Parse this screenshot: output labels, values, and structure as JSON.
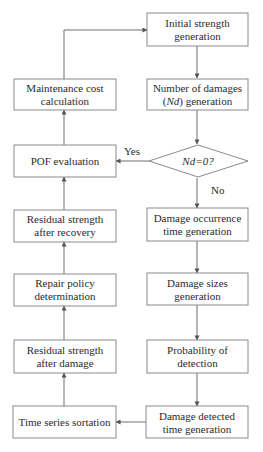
{
  "diagram": {
    "type": "flowchart",
    "nodes": {
      "initial_strength": {
        "lines": [
          "Initial strength",
          "generation"
        ]
      },
      "number_of_damages": {
        "line1": "Number of damages",
        "line2_pre": "(",
        "line2_ital": "Nd",
        "line2_post": ") generation"
      },
      "decision": {
        "ital": "Nd",
        "rest": "=0?"
      },
      "damage_occurrence": {
        "lines": [
          "Damage occurrence",
          "time generation"
        ]
      },
      "damage_sizes": {
        "lines": [
          "Damage sizes",
          "generation"
        ]
      },
      "probability_detection": {
        "lines": [
          "Probability of",
          "detection"
        ]
      },
      "damage_detected": {
        "lines": [
          "Damage detected",
          "time generation"
        ]
      },
      "time_series": {
        "lines": [
          "Time series sortation"
        ]
      },
      "residual_after_damage": {
        "lines": [
          "Residual strength",
          "after damage"
        ]
      },
      "repair_policy": {
        "lines": [
          "Repair policy",
          "determination"
        ]
      },
      "residual_after_recovery": {
        "lines": [
          "Residual strength",
          "after recovery"
        ]
      },
      "pof_evaluation": {
        "lines": [
          "POF evaluation"
        ]
      },
      "maintenance_cost": {
        "lines": [
          "Maintenance cost",
          "calculation"
        ]
      }
    },
    "edge_labels": {
      "yes": "Yes",
      "no": "No"
    },
    "edges": [
      [
        "initial_strength",
        "number_of_damages"
      ],
      [
        "number_of_damages",
        "decision"
      ],
      [
        "decision",
        "damage_occurrence",
        "No"
      ],
      [
        "decision",
        "pof_evaluation",
        "Yes"
      ],
      [
        "damage_occurrence",
        "damage_sizes"
      ],
      [
        "damage_sizes",
        "probability_detection"
      ],
      [
        "probability_detection",
        "damage_detected"
      ],
      [
        "damage_detected",
        "time_series"
      ],
      [
        "time_series",
        "residual_after_damage"
      ],
      [
        "residual_after_damage",
        "repair_policy"
      ],
      [
        "repair_policy",
        "residual_after_recovery"
      ],
      [
        "residual_after_recovery",
        "pof_evaluation"
      ],
      [
        "pof_evaluation",
        "maintenance_cost"
      ],
      [
        "maintenance_cost",
        "initial_strength"
      ]
    ]
  }
}
